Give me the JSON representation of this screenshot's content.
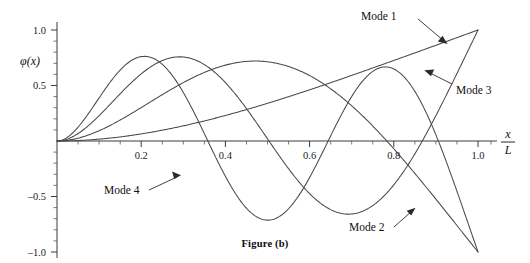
{
  "figure": {
    "caption": "Figure (b)",
    "y_axis_label": "φ(x)",
    "x_axis_label_numerator": "x",
    "x_axis_label_denominator": "L"
  },
  "chart_data": {
    "type": "line",
    "title": "Figure (b)",
    "subtitle": "",
    "xlabel": "x/L",
    "ylabel": "φ(x)",
    "xlim": [
      0.0,
      1.06
    ],
    "ylim": [
      -1.12,
      1.12
    ],
    "grid": false,
    "legend": "inline-annotations",
    "x_ticks": [
      0.2,
      0.4,
      0.6,
      0.8,
      1.0
    ],
    "x_tick_labels": [
      "0.2",
      "0.4",
      "0.6",
      "0.8",
      "1.0"
    ],
    "x_minor_ticks": [
      0.05,
      0.1,
      0.15,
      0.25,
      0.3,
      0.35,
      0.45,
      0.5,
      0.55,
      0.65,
      0.7,
      0.75,
      0.85,
      0.9,
      0.95,
      1.05
    ],
    "y_ticks": [
      -1.0,
      -0.5,
      0.5,
      1.0
    ],
    "y_tick_labels": [
      "–1.0",
      "–0.5",
      "0.5",
      "1.0"
    ],
    "y_minor_ticks": [
      -0.9,
      -0.8,
      -0.7,
      -0.6,
      -0.4,
      -0.3,
      -0.2,
      -0.1,
      0.1,
      0.2,
      0.3,
      0.4,
      0.6,
      0.7,
      0.8,
      0.9
    ],
    "series": [
      {
        "name": "Mode 1",
        "beta_L": 1.875104,
        "sigma": 0.734096,
        "x": [
          0.0,
          0.05,
          0.1,
          0.15,
          0.2,
          0.25,
          0.3,
          0.35,
          0.4,
          0.45,
          0.5,
          0.55,
          0.6,
          0.65,
          0.7,
          0.75,
          0.8,
          0.85,
          0.9,
          0.95,
          1.0
        ],
        "values": [
          0.0,
          0.008,
          0.034,
          0.074,
          0.127,
          0.194,
          0.271,
          0.358,
          0.453,
          0.554,
          0.658,
          0.765,
          0.872,
          0.978,
          1.081,
          1.18,
          1.273,
          1.36,
          1.44,
          1.51,
          1.0
        ],
        "y": [
          0.0,
          0.006,
          0.023,
          0.05,
          0.087,
          0.132,
          0.185,
          0.245,
          0.31,
          0.38,
          0.452,
          0.527,
          0.602,
          0.678,
          0.752,
          0.824,
          0.892,
          0.955,
          1.0,
          1.0,
          1.0
        ],
        "label_text": "Mode 1",
        "label_x": 0.775,
        "label_y": 1.09,
        "arrow_tip_x": 0.893,
        "arrow_tip_y": 0.963
      },
      {
        "name": "Mode 2",
        "beta_L": 4.694091,
        "sigma": 1.018467,
        "label_text": "Mode 2",
        "label_x": 0.715,
        "label_y": -0.86,
        "arrow_tip_x": 0.806,
        "arrow_tip_y": -0.695
      },
      {
        "name": "Mode 3",
        "beta_L": 7.854757,
        "sigma": 0.999225,
        "label_text": "Mode 3",
        "label_x": 0.868,
        "label_y": 0.51,
        "arrow_tip_x": 0.79,
        "arrow_tip_y": 0.645
      },
      {
        "name": "Mode 4",
        "beta_L": 10.995541,
        "sigma": 1.000033,
        "label_text": "Mode 4",
        "label_x": 0.135,
        "label_y": -0.545,
        "arrow_tip_x": 0.285,
        "arrow_tip_y": -0.435
      }
    ],
    "notes": [
      "All modes start at φ(0) = 0 (clamped end).",
      "Mode 1 is monotonically increasing and reaches 1.0 at x/L = 1.",
      "Mode 2 peaks at 1.0 near x/L ≈ 0.2 and falls to –1.0 at x/L = 1.",
      "Mode 3 peaks at 1.0 near x/L ≈ 0.14, dips to –1.0 near x/L ≈ 0.55, rises to 1.0 at x/L = 1.",
      "Mode 4 peaks at 1.0 near x/L ≈ 0.11, dips to –1.0 near x/L ≈ 0.42, peaks again near x/L ≈ 0.72, ends at –1.0 at x/L = 1."
    ]
  }
}
